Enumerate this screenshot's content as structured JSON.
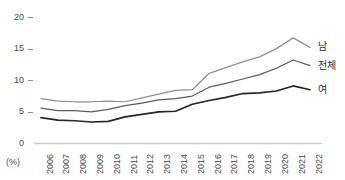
{
  "chart_data": {
    "type": "line",
    "title": "",
    "subtitle": "",
    "xlabel": "",
    "ylabel": "",
    "unit_label": "(%)",
    "categories": [
      "2006",
      "2007",
      "2008",
      "2009",
      "2010",
      "2011",
      "2012",
      "2013",
      "2014",
      "2015",
      "2016",
      "2017",
      "2018",
      "2019",
      "2020",
      "2021",
      "2022"
    ],
    "ylim": [
      0,
      20
    ],
    "yticks": [
      0,
      5,
      10,
      15,
      20
    ],
    "ytick_labels": [
      "0",
      "5",
      "10",
      "15",
      "20"
    ],
    "grid": false,
    "legend_position": "right-inline",
    "series": [
      {
        "name": "남",
        "color": "#8f8f8f",
        "values": [
          7.1,
          6.7,
          6.6,
          6.6,
          6.7,
          6.6,
          7.2,
          7.8,
          8.4,
          8.5,
          11.1,
          12.0,
          12.9,
          13.7,
          15.0,
          16.7,
          15.2
        ]
      },
      {
        "name": "전체",
        "color": "#5a5a5a",
        "values": [
          5.6,
          5.2,
          5.2,
          5.0,
          5.4,
          6.0,
          6.4,
          6.9,
          7.1,
          7.5,
          8.9,
          9.5,
          10.2,
          10.9,
          11.9,
          13.2,
          12.3
        ]
      },
      {
        "name": "여",
        "color": "#262626",
        "values": [
          4.1,
          3.7,
          3.6,
          3.4,
          3.5,
          4.2,
          4.6,
          5.0,
          5.1,
          6.2,
          6.8,
          7.3,
          7.9,
          8.0,
          8.3,
          9.1,
          8.5
        ]
      }
    ]
  },
  "axis": {
    "baseline_color": "#cccccc",
    "tick_color": "#8a8a8a",
    "label_color": "#4a4a4a"
  }
}
